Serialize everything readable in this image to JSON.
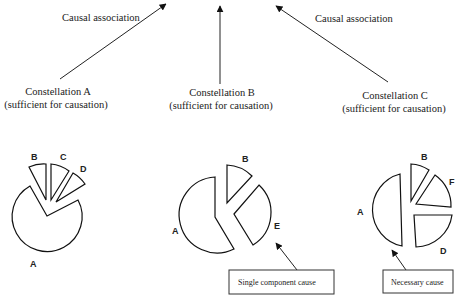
{
  "arrows": {
    "left_label": "Causal association",
    "right_label": "Causal association"
  },
  "constellations": [
    {
      "name": "Constellation A",
      "subtitle": "(sufficient for causation)",
      "pieces": [
        "A",
        "B",
        "C",
        "D"
      ]
    },
    {
      "name": "Constellation B",
      "subtitle": "(sufficient for causation)",
      "pieces": [
        "A",
        "B",
        "E"
      ]
    },
    {
      "name": "Constellation C",
      "subtitle": "(sufficient for causation)",
      "pieces": [
        "A",
        "B",
        "F",
        "D"
      ]
    }
  ],
  "callouts": {
    "single": "Single component cause",
    "necessary": "Necessary cause"
  }
}
